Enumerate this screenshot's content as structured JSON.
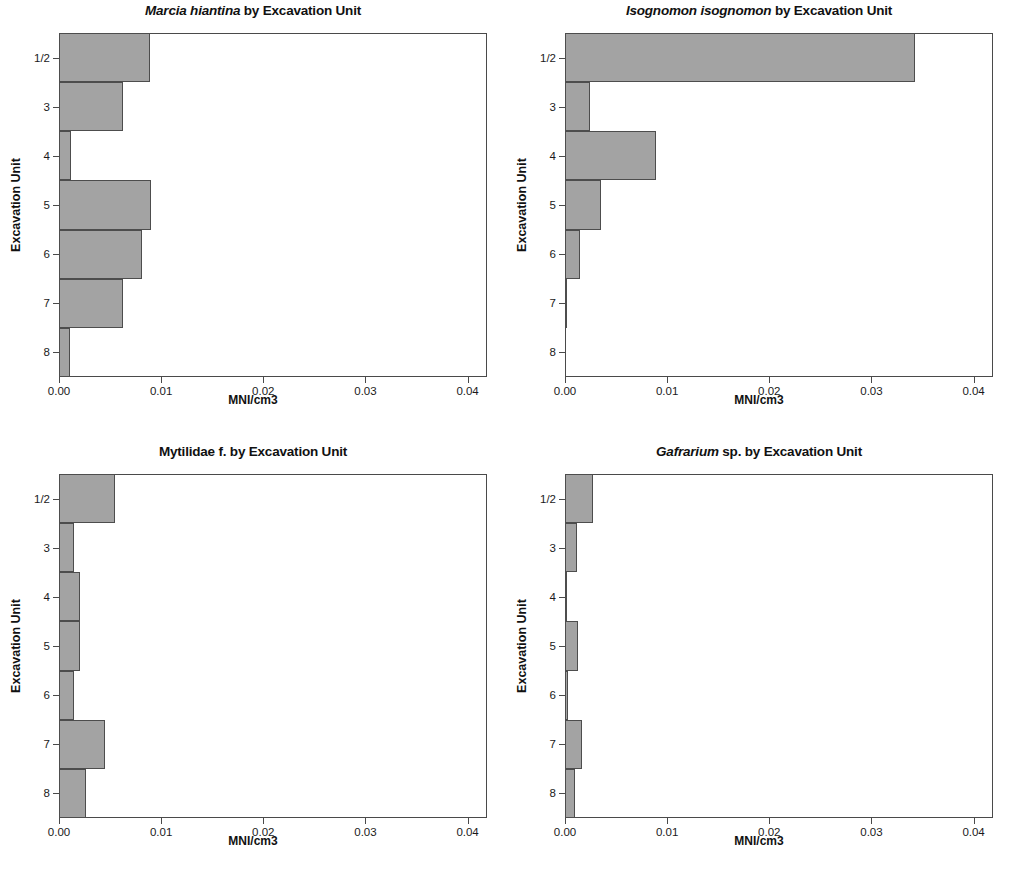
{
  "figure": {
    "axis_x_title": "MNI/cm3",
    "axis_y_title": "Excavation Unit",
    "bar_color": "#a3a3a3",
    "bar_edge_color": "#4d4d4d"
  },
  "panels": [
    {
      "title_species": "Marcia hiantina",
      "title_rest": " by Excavation Unit",
      "title_species_italic": true,
      "title_full": "Marcia hiantina by Excavation Unit"
    },
    {
      "title_species": "Isognomon isognomon",
      "title_rest": " by Excavation Unit",
      "title_species_italic": true,
      "title_full": "Isognomon isognomon by Excavation Unit"
    },
    {
      "title_species": "Mytilidae",
      "title_rest": " f. by Excavation Unit",
      "title_species_italic": false,
      "title_full": "Mytilidae f. by Excavation Unit"
    },
    {
      "title_species": "Gafrarium",
      "title_rest": " sp. by Excavation Unit",
      "title_species_italic": true,
      "title_full": "Gafrarium sp. by Excavation Unit"
    }
  ],
  "chart_data": [
    {
      "type": "bar",
      "orientation": "horizontal",
      "title": "Marcia hiantina by Excavation Unit",
      "xlabel": "MNI/cm3",
      "ylabel": "Excavation Unit",
      "categories": [
        "1/2",
        "3",
        "4",
        "5",
        "6",
        "7",
        "8"
      ],
      "values": [
        0.0089,
        0.0063,
        0.0012,
        0.009,
        0.0081,
        0.0063,
        0.0011
      ],
      "xlim": [
        0.0,
        0.0419
      ],
      "xticks": [
        0.0,
        0.01,
        0.02,
        0.03,
        0.04
      ],
      "xticklabels": [
        "0.00",
        "0.01",
        "0.02",
        "0.03",
        "0.04"
      ],
      "grid": false,
      "legend": false
    },
    {
      "type": "bar",
      "orientation": "horizontal",
      "title": "Isognomon isognomon by Excavation Unit",
      "xlabel": "MNI/cm3",
      "ylabel": "Excavation Unit",
      "categories": [
        "1/2",
        "3",
        "4",
        "5",
        "6",
        "7",
        "8"
      ],
      "values": [
        0.0343,
        0.0024,
        0.0089,
        0.0035,
        0.0015,
        0.0002,
        0.0
      ],
      "xlim": [
        0.0,
        0.0419
      ],
      "xticks": [
        0.0,
        0.01,
        0.02,
        0.03,
        0.04
      ],
      "xticklabels": [
        "0.00",
        "0.01",
        "0.02",
        "0.03",
        "0.04"
      ],
      "grid": false,
      "legend": false
    },
    {
      "type": "bar",
      "orientation": "horizontal",
      "title": "Mytilidae f. by Excavation Unit",
      "xlabel": "MNI/cm3",
      "ylabel": "Excavation Unit",
      "categories": [
        "1/2",
        "3",
        "4",
        "5",
        "6",
        "7",
        "8"
      ],
      "values": [
        0.0055,
        0.0015,
        0.0021,
        0.0021,
        0.0015,
        0.0045,
        0.0026
      ],
      "xlim": [
        0.0,
        0.0419
      ],
      "xticks": [
        0.0,
        0.01,
        0.02,
        0.03,
        0.04
      ],
      "xticklabels": [
        "0.00",
        "0.01",
        "0.02",
        "0.03",
        "0.04"
      ],
      "grid": false,
      "legend": false
    },
    {
      "type": "bar",
      "orientation": "horizontal",
      "title": "Gafrarium sp. by Excavation Unit",
      "xlabel": "MNI/cm3",
      "ylabel": "Excavation Unit",
      "categories": [
        "1/2",
        "3",
        "4",
        "5",
        "6",
        "7",
        "8"
      ],
      "values": [
        0.0027,
        0.0012,
        0.0001,
        0.0013,
        0.0003,
        0.0017,
        0.001
      ],
      "xlim": [
        0.0,
        0.0419
      ],
      "xticks": [
        0.0,
        0.01,
        0.02,
        0.03,
        0.04
      ],
      "xticklabels": [
        "0.00",
        "0.01",
        "0.02",
        "0.03",
        "0.04"
      ],
      "grid": false,
      "legend": false
    }
  ]
}
